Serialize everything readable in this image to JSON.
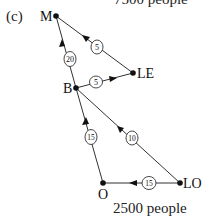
{
  "panel_label": "(c)",
  "top_caption": "7500 people",
  "bottom_caption": "2500 people",
  "nodes": {
    "M": {
      "label": "M",
      "x": 56,
      "y": 16
    },
    "LE": {
      "label": "LE",
      "x": 133,
      "y": 73
    },
    "B": {
      "label": "B",
      "x": 76,
      "y": 88
    },
    "O": {
      "label": "O",
      "x": 103,
      "y": 183
    },
    "LO": {
      "label": "LO",
      "x": 180,
      "y": 183
    }
  },
  "edges": [
    {
      "from": "B",
      "to": "M",
      "weight": "20"
    },
    {
      "from": "LE",
      "to": "M",
      "weight": "5"
    },
    {
      "from": "B",
      "to": "LE",
      "weight": "5"
    },
    {
      "from": "O",
      "to": "B",
      "weight": "15"
    },
    {
      "from": "LO",
      "to": "B",
      "weight": "10"
    },
    {
      "from": "LO",
      "to": "O",
      "weight": "15"
    }
  ]
}
